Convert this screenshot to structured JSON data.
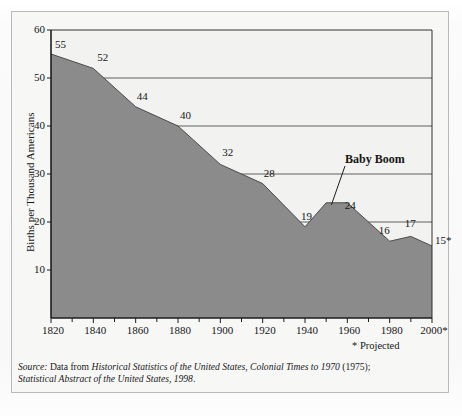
{
  "chart_data": {
    "type": "area",
    "title": "",
    "xlabel": "",
    "ylabel": "Births per Thousand Americans",
    "xlim": [
      1820,
      2000
    ],
    "ylim": [
      0,
      60
    ],
    "yticks": [
      10,
      20,
      30,
      40,
      50,
      60
    ],
    "xticks": [
      "1820",
      "1840",
      "1860",
      "1880",
      "1900",
      "1920",
      "1940",
      "1960",
      "1980",
      "2000*"
    ],
    "x": [
      1820,
      1840,
      1860,
      1880,
      1900,
      1920,
      1940,
      1950,
      1960,
      1980,
      1990,
      2000
    ],
    "values": [
      55,
      52,
      44,
      40,
      32,
      28,
      19,
      24,
      24,
      16,
      17,
      15
    ],
    "point_labels": [
      {
        "x": 1820,
        "y": 55,
        "text": "55"
      },
      {
        "x": 1840,
        "y": 52,
        "text": "52"
      },
      {
        "x": 1860,
        "y": 44,
        "text": "44"
      },
      {
        "x": 1880,
        "y": 40,
        "text": "40"
      },
      {
        "x": 1900,
        "y": 32,
        "text": "32"
      },
      {
        "x": 1920,
        "y": 28,
        "text": "28"
      },
      {
        "x": 1940,
        "y": 19,
        "text": "19"
      },
      {
        "x": 1955,
        "y": 24,
        "text": "24"
      },
      {
        "x": 1980,
        "y": 16,
        "text": "16"
      },
      {
        "x": 1990,
        "y": 17,
        "text": "17"
      },
      {
        "x": 2000,
        "y": 15,
        "text": "15*"
      }
    ],
    "annotations": [
      {
        "text": "Baby Boom",
        "target_x": 1952,
        "target_y": 24
      }
    ],
    "grid": true,
    "legend": "none",
    "area_color": "#8b8b8b",
    "line_color": "#4a4a4a",
    "grid_color": "#4e4e4e",
    "axis_color": "#1d1d1d",
    "plot_bg": "#f2f2f0"
  },
  "labels": {
    "y_axis_title": "Births per Thousand Americans",
    "baby_boom": "Baby Boom",
    "projected": "* Projected"
  },
  "source": {
    "prefix": "Source:",
    "line1_lead": " Data from ",
    "line1_title": "Historical Statistics of the United States, Colonial Times to 1970",
    "line1_tail": " (1975);",
    "line2_title": "Statistical Abstract of the United States, 1998",
    "line2_tail": "."
  }
}
